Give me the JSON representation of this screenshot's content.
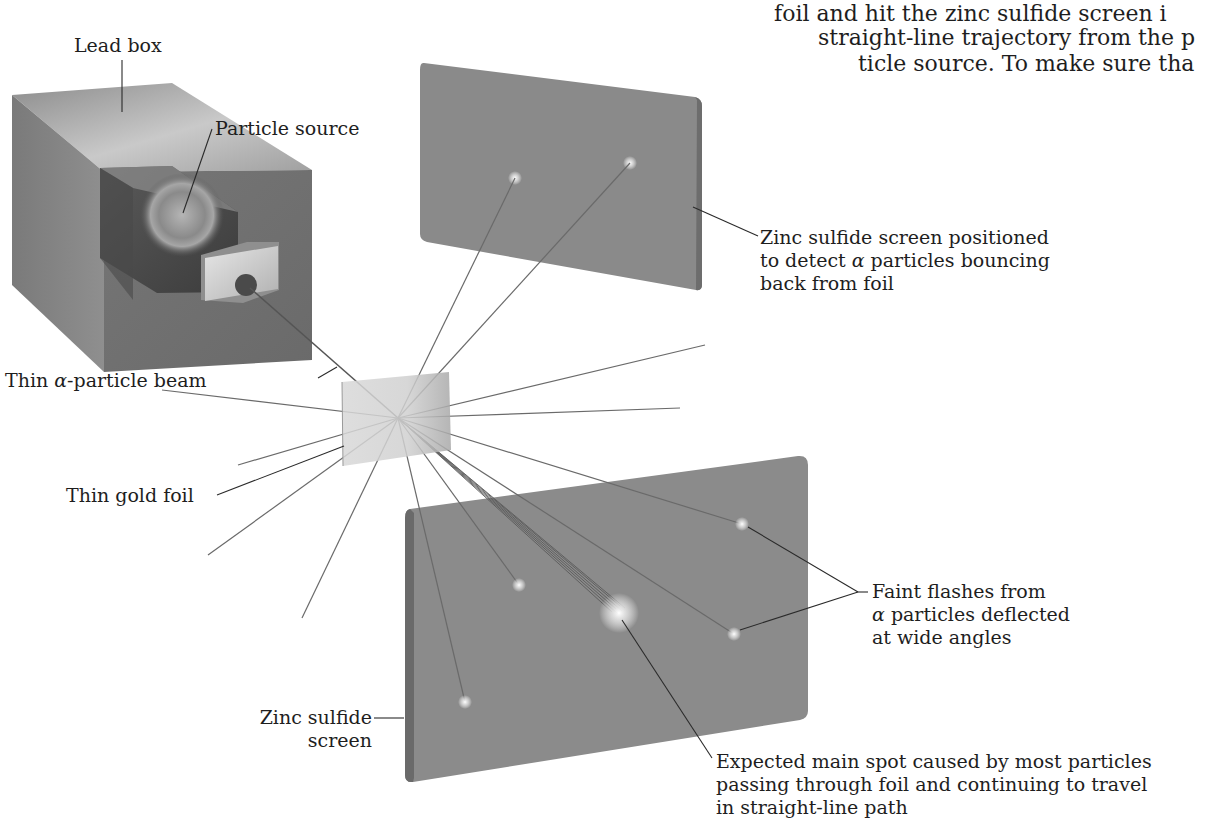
{
  "body_text": {
    "lines": [
      "foil and hit the zinc sulfide screen i",
      "straight-line trajectory from the p",
      "ticle source. To make sure tha"
    ]
  },
  "labels": {
    "lead_box": "Lead box",
    "particle_source": "Particle source",
    "back_screen": {
      "line1": "Zinc sulfide screen positioned",
      "line2_pre": "to detect ",
      "line2_greek": "α",
      "line2_post": " particles bouncing",
      "line3": "back from foil"
    },
    "beam": {
      "pre": "Thin ",
      "greek": "α",
      "post": "-particle beam"
    },
    "gold_foil": "Thin gold foil",
    "faint_flashes": {
      "line1": "Faint flashes from",
      "line2_greek": "α",
      "line2_post": " particles deflected",
      "line3": "at wide angles"
    },
    "front_screen": {
      "line1": "Zinc sulfide",
      "line2": "screen"
    },
    "main_spot": {
      "line1": "Expected main spot caused by most particles",
      "line2": "passing through foil and continuing to travel",
      "line3": "in straight-line path"
    }
  },
  "colors": {
    "screen": "#8a8a8a",
    "box_dark": "#6e6e6e",
    "foil": "#d4d4d4",
    "ray": "#6a6a6a",
    "leader": "#2a2a2a"
  }
}
